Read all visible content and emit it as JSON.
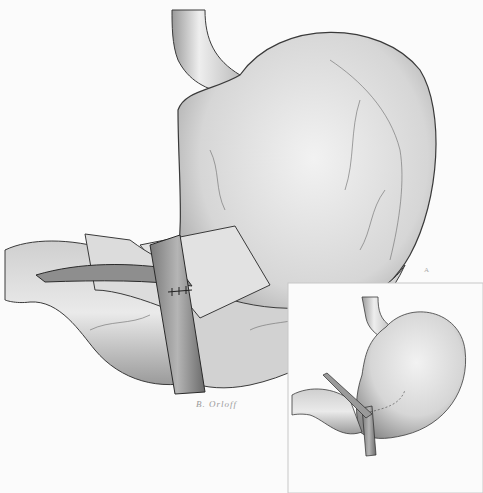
{
  "illustration": {
    "subject": "stomach with pyloric band procedure",
    "signature": "B. Orloff",
    "corner_mark": "A",
    "colors": {
      "background": "#fbfbfb",
      "organ_fill": "#d8d8d8",
      "organ_shadow": "#7a7a7a",
      "outline": "#3a3a3a",
      "vessel": "#6a6a6a"
    }
  },
  "inset": {
    "label": "inset view: completed procedure with suture line"
  }
}
